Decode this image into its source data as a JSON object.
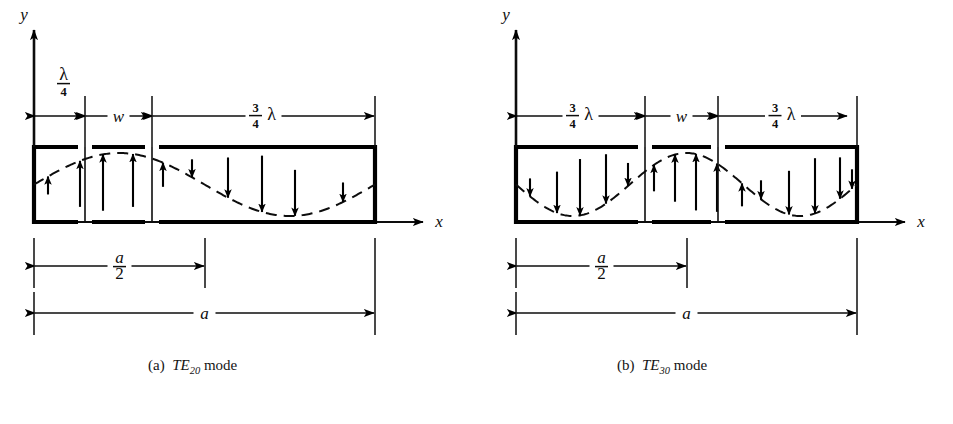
{
  "figure": {
    "title_hidden": "",
    "background": "#ffffff",
    "ink": "#000000"
  },
  "axes": {
    "y_label": "y",
    "x_label": "x"
  },
  "panels": [
    {
      "id": "a",
      "caption_index": "(a)",
      "caption_mode": "TE",
      "caption_sub": "20",
      "caption_tail": "mode",
      "caption_full": "(a)  TE20 mode",
      "top_dimensions": [
        {
          "name": "quarter-lambda",
          "label_num": "3",
          "label_text": "λ/4",
          "frac_top": "",
          "frac_bottom": "4",
          "symbol": "λ",
          "position": "above-line",
          "from_px": 34,
          "to_px": 85
        },
        {
          "name": "slot-width",
          "label_text": "w",
          "italic": true,
          "position": "inline",
          "from_px": 85,
          "to_px": 152
        },
        {
          "name": "three-quarter-lambda",
          "frac_top": "3",
          "frac_bottom": "4",
          "symbol": "λ",
          "label_text": "3/4 λ",
          "position": "inline",
          "from_px": 152,
          "to_px": 375
        }
      ],
      "bottom_dimensions": [
        {
          "name": "half-a",
          "frac_top": "a",
          "frac_bottom": "2",
          "label_text": "a/2",
          "from_px": 34,
          "to_px": 205
        },
        {
          "name": "full-a",
          "label_text": "a",
          "italic": true,
          "from_px": 34,
          "to_px": 375
        }
      ],
      "waveguide": {
        "left_px": 34,
        "right_px": 375,
        "top_px": 147,
        "bottom_px": 222
      },
      "dividers_px": [
        85,
        152
      ],
      "field": {
        "description": "E-field arrows following one full sinusoid",
        "half_cycles": 2,
        "first_lobe_direction": "up"
      }
    },
    {
      "id": "b",
      "caption_index": "(b)",
      "caption_mode": "TE",
      "caption_sub": "30",
      "caption_tail": "mode",
      "caption_full": "(b)  TE30 mode",
      "top_dimensions": [
        {
          "name": "three-quarter-lambda-left",
          "frac_top": "3",
          "frac_bottom": "4",
          "symbol": "λ",
          "label_text": "3/4 λ",
          "position": "inline",
          "from_px": 516,
          "to_px": 645
        },
        {
          "name": "slot-width",
          "label_text": "w",
          "italic": true,
          "position": "inline",
          "from_px": 645,
          "to_px": 718
        },
        {
          "name": "three-quarter-lambda-right",
          "frac_top": "3",
          "frac_bottom": "4",
          "symbol": "λ",
          "label_text": "3/4 λ",
          "position": "inline",
          "from_px": 718,
          "to_px": 848
        }
      ],
      "bottom_dimensions": [
        {
          "name": "half-a",
          "frac_top": "a",
          "frac_bottom": "2",
          "label_text": "a/2",
          "from_px": 516,
          "to_px": 687
        },
        {
          "name": "full-a",
          "label_text": "a",
          "italic": true,
          "from_px": 516,
          "to_px": 857
        }
      ],
      "waveguide": {
        "left_px": 516,
        "right_px": 857,
        "top_px": 147,
        "bottom_px": 222
      },
      "dividers_px": [
        645,
        718
      ],
      "field": {
        "description": "E-field arrows following one and a half sinusoids",
        "half_cycles": 3,
        "first_lobe_direction": "down"
      }
    }
  ],
  "chart_data": {
    "type": "line",
    "xlabel": "x",
    "ylabel": "y",
    "grid": false,
    "legend": null,
    "series": [
      {
        "name": "TE20 mode field",
        "panel": "a",
        "half_cycles": 2,
        "x_range_px": [
          34,
          375
        ],
        "samples": [
          {
            "x_px": 34,
            "amp": 0.0
          },
          {
            "x_px": 62,
            "amp": 0.48
          },
          {
            "x_px": 90,
            "amp": 0.82
          },
          {
            "x_px": 119,
            "amp": 1.0
          },
          {
            "x_px": 147,
            "amp": 0.93
          },
          {
            "x_px": 176,
            "amp": 0.62
          },
          {
            "x_px": 204,
            "amp": 0.18
          },
          {
            "x_px": 233,
            "amp": -0.33
          },
          {
            "x_px": 261,
            "amp": -0.72
          },
          {
            "x_px": 290,
            "amp": -0.96
          },
          {
            "x_px": 318,
            "amp": -0.99
          },
          {
            "x_px": 347,
            "amp": -0.72
          },
          {
            "x_px": 375,
            "amp": -0.2
          }
        ],
        "arrows": [
          {
            "x_px": 48,
            "dir": "up",
            "len": 0.3
          },
          {
            "x_px": 80,
            "dir": "up",
            "len": 0.8
          },
          {
            "x_px": 103,
            "dir": "up",
            "len": 0.98
          },
          {
            "x_px": 133,
            "dir": "up",
            "len": 0.92
          },
          {
            "x_px": 163,
            "dir": "up",
            "len": 0.42
          },
          {
            "x_px": 192,
            "dir": "down",
            "len": 0.28
          },
          {
            "x_px": 228,
            "dir": "down",
            "len": 0.7
          },
          {
            "x_px": 262,
            "dir": "down",
            "len": 0.98
          },
          {
            "x_px": 295,
            "dir": "down",
            "len": 0.8
          },
          {
            "x_px": 343,
            "dir": "down",
            "len": 0.34
          }
        ]
      },
      {
        "name": "TE30 mode field",
        "panel": "b",
        "half_cycles": 3,
        "x_range_px": [
          516,
          857
        ],
        "samples": [
          {
            "x_px": 516,
            "amp": 0.0
          },
          {
            "x_px": 545,
            "amp": -0.6
          },
          {
            "x_px": 573,
            "amp": -0.95
          },
          {
            "x_px": 602,
            "amp": -0.95
          },
          {
            "x_px": 630,
            "amp": -0.55
          },
          {
            "x_px": 659,
            "amp": 0.1
          },
          {
            "x_px": 687,
            "amp": 0.7
          },
          {
            "x_px": 716,
            "amp": 0.99
          },
          {
            "x_px": 744,
            "amp": 0.8
          },
          {
            "x_px": 773,
            "amp": 0.22
          },
          {
            "x_px": 801,
            "amp": -0.5
          },
          {
            "x_px": 829,
            "amp": -0.92
          },
          {
            "x_px": 857,
            "amp": -0.7
          }
        ],
        "arrows": [
          {
            "x_px": 530,
            "dir": "down",
            "len": 0.3
          },
          {
            "x_px": 557,
            "dir": "down",
            "len": 0.72
          },
          {
            "x_px": 580,
            "dir": "down",
            "len": 0.98
          },
          {
            "x_px": 606,
            "dir": "down",
            "len": 0.86
          },
          {
            "x_px": 628,
            "dir": "down",
            "len": 0.4
          },
          {
            "x_px": 654,
            "dir": "up",
            "len": 0.46
          },
          {
            "x_px": 675,
            "dir": "up",
            "len": 0.82
          },
          {
            "x_px": 696,
            "dir": "up",
            "len": 0.98
          },
          {
            "x_px": 717,
            "dir": "up",
            "len": 0.84
          },
          {
            "x_px": 742,
            "dir": "up",
            "len": 0.4
          },
          {
            "x_px": 761,
            "dir": "down",
            "len": 0.33
          },
          {
            "x_px": 789,
            "dir": "down",
            "len": 0.76
          },
          {
            "x_px": 815,
            "dir": "down",
            "len": 0.96
          },
          {
            "x_px": 840,
            "dir": "down",
            "len": 0.72
          },
          {
            "x_px": 852,
            "dir": "down",
            "len": 0.34
          }
        ]
      }
    ]
  }
}
